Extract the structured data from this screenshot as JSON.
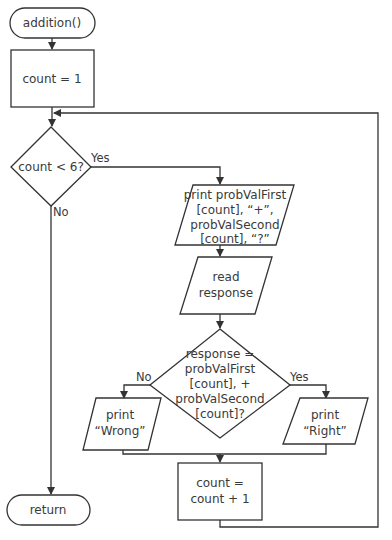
{
  "diagram": {
    "type": "flowchart",
    "nodes": {
      "start": {
        "shape": "terminator",
        "label": "addition()"
      },
      "init": {
        "shape": "process",
        "label": "count = 1"
      },
      "loop_check": {
        "shape": "decision",
        "label": "count < 6?"
      },
      "print_problem": {
        "shape": "io",
        "lines": [
          "print probValFirst",
          "[count], “+”,",
          "probValSecond",
          "[count], “?”"
        ]
      },
      "read_response": {
        "shape": "io",
        "lines": [
          "read",
          "response"
        ]
      },
      "answer_check": {
        "shape": "decision",
        "lines": [
          "response =",
          "probValFirst",
          "[count], +",
          "probValSecond",
          "[count]?"
        ]
      },
      "print_wrong": {
        "shape": "io",
        "lines": [
          "print",
          "“Wrong”"
        ]
      },
      "print_right": {
        "shape": "io",
        "lines": [
          "print",
          "“Right”"
        ]
      },
      "increment": {
        "shape": "process",
        "lines": [
          "count =",
          "count + 1"
        ]
      },
      "end": {
        "shape": "terminator",
        "label": "return"
      }
    },
    "edge_labels": {
      "loop_yes": "Yes",
      "loop_no": "No",
      "answer_no": "No",
      "answer_yes": "Yes"
    },
    "edges": [
      {
        "from": "start",
        "to": "init"
      },
      {
        "from": "init",
        "to": "loop_check"
      },
      {
        "from": "loop_check",
        "to": "print_problem",
        "label": "Yes"
      },
      {
        "from": "loop_check",
        "to": "end",
        "label": "No"
      },
      {
        "from": "print_problem",
        "to": "read_response"
      },
      {
        "from": "read_response",
        "to": "answer_check"
      },
      {
        "from": "answer_check",
        "to": "print_wrong",
        "label": "No"
      },
      {
        "from": "answer_check",
        "to": "print_right",
        "label": "Yes"
      },
      {
        "from": "print_wrong",
        "to": "increment"
      },
      {
        "from": "print_right",
        "to": "increment"
      },
      {
        "from": "increment",
        "to": "loop_check"
      }
    ]
  }
}
